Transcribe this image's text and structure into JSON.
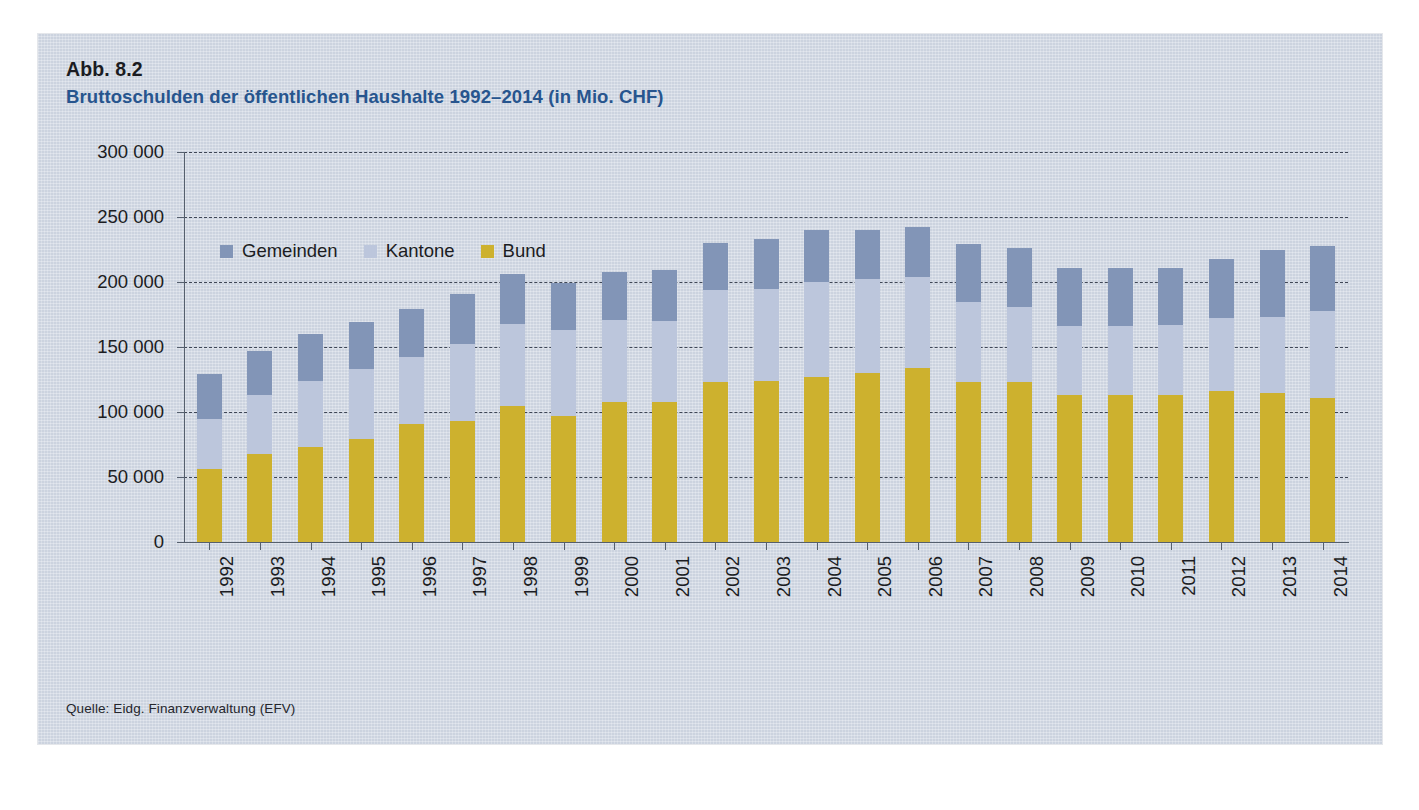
{
  "figure": {
    "number": "Abb. 8.2",
    "title": "Bruttoschulden der öffentlichen Haushalte 1992–2014 (in Mio. CHF)",
    "source": "Quelle: Eidg. Finanzverwaltung (EFV)",
    "title_color": "#27558e",
    "panel_bg": "#ccd3df"
  },
  "legend": {
    "position": "top-left-inside-plot",
    "items": [
      {
        "label": "Gemeinden",
        "color": "#8295b7"
      },
      {
        "label": "Kantone",
        "color": "#bcc6dc"
      },
      {
        "label": "Bund",
        "color": "#cdb12e"
      }
    ]
  },
  "axes": {
    "y_tick_labels": [
      "300 000",
      "250 000",
      "200 000",
      "150 000",
      "100 000",
      "50 000",
      "0"
    ],
    "y_tick_values": [
      300000,
      250000,
      200000,
      150000,
      100000,
      50000,
      0
    ],
    "x_tick_labels": [
      "1992",
      "1993",
      "1994",
      "1995",
      "1996",
      "1997",
      "1998",
      "1999",
      "2000",
      "2001",
      "2002",
      "2003",
      "2004",
      "2005",
      "2006",
      "2007",
      "2008",
      "2009",
      "2010",
      "2011",
      "2012",
      "2013",
      "2014"
    ]
  },
  "chart_data": {
    "type": "bar",
    "stacked": true,
    "title": "Bruttoschulden der öffentlichen Haushalte 1992–2014 (in Mio. CHF)",
    "xlabel": "",
    "ylabel": "in Mio. CHF",
    "ylim": [
      0,
      300000
    ],
    "ytick_step": 50000,
    "grid": true,
    "legend_position": "top-left",
    "categories": [
      "1992",
      "1993",
      "1994",
      "1995",
      "1996",
      "1997",
      "1998",
      "1999",
      "2000",
      "2001",
      "2002",
      "2003",
      "2004",
      "2005",
      "2006",
      "2007",
      "2008",
      "2009",
      "2010",
      "2011",
      "2012",
      "2013",
      "2014"
    ],
    "series": [
      {
        "name": "Bund",
        "color": "#cdb12e",
        "values": [
          56000,
          68000,
          73000,
          79000,
          91000,
          93000,
          105000,
          97000,
          108000,
          108000,
          123000,
          124000,
          127000,
          130000,
          134000,
          123000,
          123000,
          113000,
          113000,
          113000,
          116000,
          115000,
          111000
        ]
      },
      {
        "name": "Kantone",
        "color": "#bcc6dc",
        "values": [
          39000,
          45000,
          51000,
          54000,
          51000,
          59000,
          63000,
          66000,
          63000,
          62000,
          71000,
          71000,
          73000,
          72000,
          70000,
          62000,
          58000,
          53000,
          53000,
          54000,
          56000,
          58000,
          67000
        ]
      },
      {
        "name": "Gemeinden",
        "color": "#8295b7",
        "values": [
          34000,
          34000,
          36000,
          36000,
          37000,
          39000,
          38000,
          36000,
          37000,
          39000,
          36000,
          38000,
          40000,
          38000,
          38000,
          44000,
          45000,
          45000,
          45000,
          44000,
          46000,
          52000,
          50000
        ]
      }
    ],
    "totals": [
      129000,
      147000,
      160000,
      169000,
      179000,
      191000,
      206000,
      199000,
      208000,
      209000,
      230000,
      233000,
      240000,
      240000,
      242000,
      229000,
      226000,
      211000,
      211000,
      211000,
      218000,
      225000,
      228000
    ]
  }
}
